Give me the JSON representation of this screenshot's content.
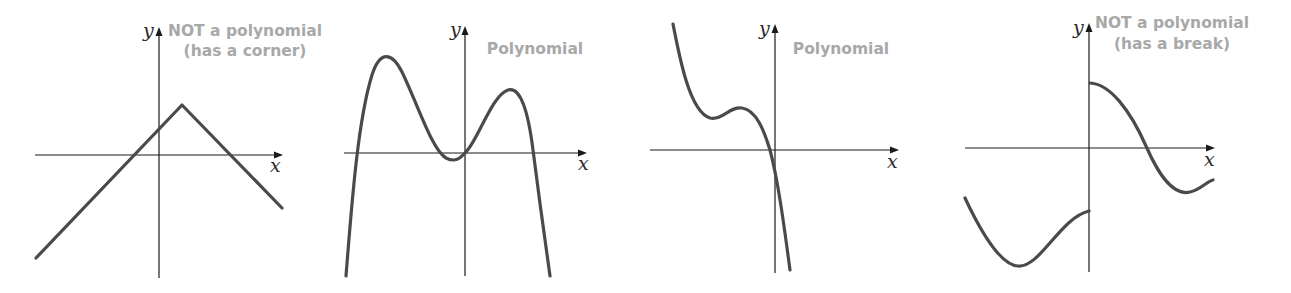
{
  "figure": {
    "panels": [
      {
        "id": "corner",
        "caption_line1": "NOT a polynomial",
        "caption_line2": "(has a corner)",
        "x_label": "x",
        "y_label": "y",
        "classification": "not-polynomial"
      },
      {
        "id": "quartic",
        "caption_line1": "Polynomial",
        "caption_line2": "",
        "x_label": "x",
        "y_label": "y",
        "classification": "polynomial"
      },
      {
        "id": "cubic",
        "caption_line1": "Polynomial",
        "caption_line2": "",
        "x_label": "x",
        "y_label": "y",
        "classification": "polynomial"
      },
      {
        "id": "break",
        "caption_line1": "NOT a polynomial",
        "caption_line2": "(has a break)",
        "x_label": "x",
        "y_label": "y",
        "classification": "not-polynomial"
      }
    ],
    "colors": {
      "curve": "#4a4a4a",
      "axis": "#1a1a1a",
      "caption": "#a8a8a8"
    }
  }
}
